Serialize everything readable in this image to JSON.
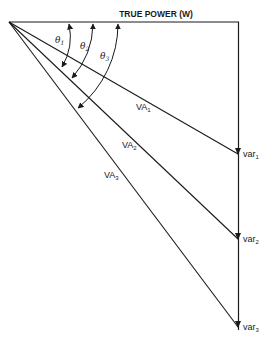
{
  "diagram": {
    "title": "TRUE POWER (W)",
    "angles": [
      {
        "symbol": "θ",
        "sub": "1"
      },
      {
        "symbol": "θ",
        "sub": "2"
      },
      {
        "symbol": "θ",
        "sub": "3"
      }
    ],
    "apparent_power": [
      {
        "label": "VA",
        "sub": "1"
      },
      {
        "label": "VA",
        "sub": "2"
      },
      {
        "label": "VA",
        "sub": "3"
      }
    ],
    "reactive_power": [
      {
        "label": "var",
        "sub": "1"
      },
      {
        "label": "var",
        "sub": "2"
      },
      {
        "label": "var",
        "sub": "3"
      }
    ],
    "colors": {
      "line": "#1a1a1a",
      "background": "#ffffff"
    }
  }
}
